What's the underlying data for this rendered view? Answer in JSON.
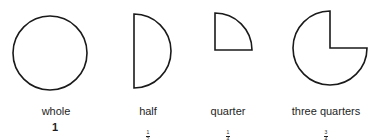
{
  "colors": {
    "stroke": "#1a1a1a",
    "fill": "#ffffff",
    "text": "#1e1e1e"
  },
  "shapes": [
    {
      "id": "whole",
      "label": "whole",
      "fraction": "1",
      "numerator": "1",
      "denominator": "",
      "shape": "full-circle-icon"
    },
    {
      "id": "half",
      "label": "half",
      "fraction": "1/2",
      "numerator": "1",
      "denominator": "2",
      "shape": "half-circle-icon"
    },
    {
      "id": "quarter",
      "label": "quarter",
      "fraction": "1/4",
      "numerator": "1",
      "denominator": "4",
      "shape": "quarter-circle-icon"
    },
    {
      "id": "three-quarters",
      "label": "three quarters",
      "fraction": "3/4",
      "numerator": "3",
      "denominator": "4",
      "shape": "three-quarter-circle-icon"
    }
  ]
}
